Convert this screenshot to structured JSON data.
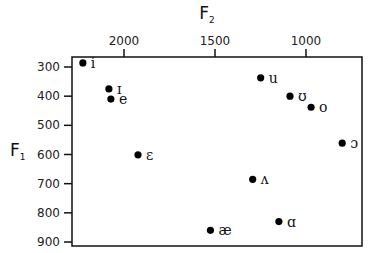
{
  "chart_data": {
    "type": "scatter",
    "title": "",
    "xlabel": "F2",
    "ylabel": "F1",
    "x_axis": {
      "position": "top",
      "reversed": true,
      "ticks": [
        2000,
        1500,
        1000
      ],
      "tick_labels": [
        "2000",
        "1500",
        "1000"
      ],
      "range": [
        2290,
        690
      ]
    },
    "y_axis": {
      "position": "left",
      "reversed": true,
      "ticks": [
        300,
        400,
        500,
        600,
        700,
        800,
        900
      ],
      "tick_labels": [
        "300",
        "400",
        "500",
        "600",
        "700",
        "800",
        "900"
      ],
      "range": [
        265,
        915
      ]
    },
    "grid": false,
    "legend": null,
    "points": [
      {
        "label": "i",
        "f2": 2226,
        "f1": 286
      },
      {
        "label": "ɪ",
        "f2": 2083,
        "f1": 375
      },
      {
        "label": "e",
        "f2": 2072,
        "f1": 410
      },
      {
        "label": "ɛ",
        "f2": 1923,
        "f1": 601
      },
      {
        "label": "æ",
        "f2": 1525,
        "f1": 860
      },
      {
        "label": "ʌ",
        "f2": 1293,
        "f1": 685
      },
      {
        "label": "ɑ",
        "f2": 1149,
        "f1": 830
      },
      {
        "label": "u",
        "f2": 1249,
        "f1": 337
      },
      {
        "label": "ʊ",
        "f2": 1088,
        "f1": 400
      },
      {
        "label": "o",
        "f2": 972,
        "f1": 438
      },
      {
        "label": "ɔ",
        "f2": 801,
        "f1": 561
      }
    ]
  },
  "labels": {
    "x_title_main": "F",
    "x_title_sub": "2",
    "y_title_main": "F",
    "y_title_sub": "1"
  }
}
